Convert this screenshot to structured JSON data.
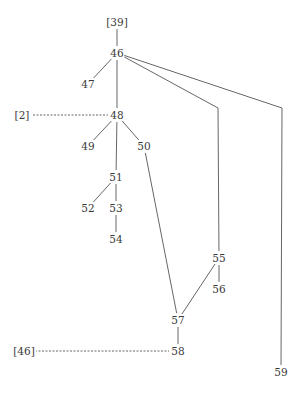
{
  "diagram": {
    "type": "stemma-tree",
    "nodes": [
      {
        "id": "39ref",
        "label": "[39]",
        "x": 117,
        "y": 22,
        "kind": "reference"
      },
      {
        "id": "46",
        "label": "46",
        "x": 117,
        "y": 53
      },
      {
        "id": "47",
        "label": "47",
        "x": 88,
        "y": 84
      },
      {
        "id": "2ref",
        "label": "[2]",
        "x": 22,
        "y": 115,
        "kind": "reference"
      },
      {
        "id": "48",
        "label": "48",
        "x": 117,
        "y": 115
      },
      {
        "id": "49",
        "label": "49",
        "x": 88,
        "y": 146
      },
      {
        "id": "50",
        "label": "50",
        "x": 144,
        "y": 146
      },
      {
        "id": "51",
        "label": "51",
        "x": 116,
        "y": 177
      },
      {
        "id": "52",
        "label": "52",
        "x": 88,
        "y": 208
      },
      {
        "id": "53",
        "label": "53",
        "x": 116,
        "y": 208
      },
      {
        "id": "54",
        "label": "54",
        "x": 116,
        "y": 239
      },
      {
        "id": "55",
        "label": "55",
        "x": 219,
        "y": 258
      },
      {
        "id": "56",
        "label": "56",
        "x": 219,
        "y": 289
      },
      {
        "id": "57",
        "label": "57",
        "x": 178,
        "y": 320
      },
      {
        "id": "46ref",
        "label": "[46]",
        "x": 24,
        "y": 351,
        "kind": "reference"
      },
      {
        "id": "58",
        "label": "58",
        "x": 178,
        "y": 351
      },
      {
        "id": "59",
        "label": "59",
        "x": 281,
        "y": 372
      }
    ],
    "edges": [
      {
        "from": "39ref",
        "to": "46",
        "style": "solid"
      },
      {
        "from": "46",
        "to": "47",
        "style": "solid"
      },
      {
        "from": "46",
        "to": "48",
        "style": "solid"
      },
      {
        "from": "46",
        "to": "55",
        "style": "solid",
        "via": [
          [
            218,
            108
          ]
        ]
      },
      {
        "from": "46",
        "to": "59",
        "style": "solid",
        "via": [
          [
            282,
            108
          ]
        ]
      },
      {
        "from": "2ref",
        "to": "48",
        "style": "dashed"
      },
      {
        "from": "48",
        "to": "49",
        "style": "solid"
      },
      {
        "from": "48",
        "to": "50",
        "style": "solid"
      },
      {
        "from": "48",
        "to": "51",
        "style": "solid"
      },
      {
        "from": "51",
        "to": "52",
        "style": "solid"
      },
      {
        "from": "51",
        "to": "53",
        "style": "solid"
      },
      {
        "from": "53",
        "to": "54",
        "style": "solid"
      },
      {
        "from": "50",
        "to": "57",
        "style": "solid"
      },
      {
        "from": "55",
        "to": "56",
        "style": "solid"
      },
      {
        "from": "55",
        "to": "57",
        "style": "solid"
      },
      {
        "from": "57",
        "to": "58",
        "style": "solid"
      },
      {
        "from": "46ref",
        "to": "58",
        "style": "dashed"
      }
    ]
  }
}
